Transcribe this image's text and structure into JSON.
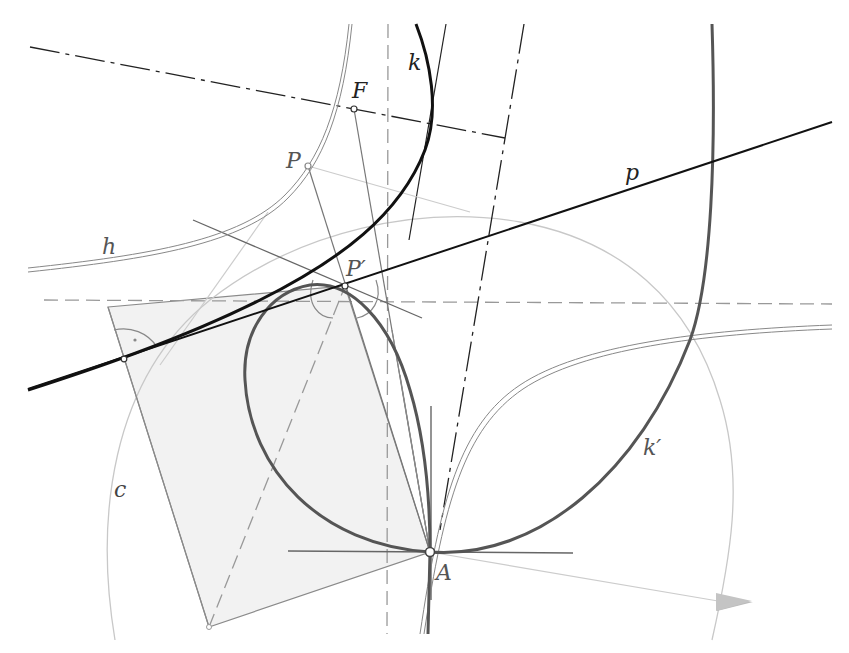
{
  "diagram": {
    "labels": {
      "F": "F",
      "k": "k",
      "P": "P",
      "p": "p",
      "h": "h",
      "P_prime": "P′",
      "c": "c",
      "k_prime": "k′",
      "A": "A"
    },
    "colors": {
      "background": "#ffffff",
      "curve_k": "#111111",
      "curve_k_prime": "#555555",
      "hyperbola_h": "#888888",
      "line_p": "#111111",
      "circle_c": "#c8c8c8",
      "construction": "#777777",
      "dashed": "#999999",
      "dash_dot": "#222222",
      "shaded_fill": "#f2f2f2",
      "light_line": "#cccccc",
      "label_dark": "#222222",
      "label_gray": "#666666"
    },
    "points": {
      "F": [
        354,
        109
      ],
      "P": [
        308,
        166
      ],
      "P_prime": [
        345,
        286
      ],
      "A": [
        430,
        552
      ],
      "right_angle_vertex": [
        124,
        359
      ],
      "square_bottom": [
        209,
        627
      ]
    }
  }
}
